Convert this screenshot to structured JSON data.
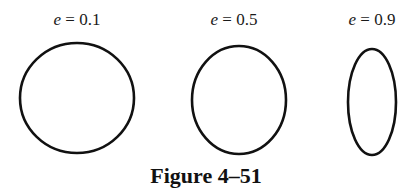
{
  "figure": {
    "caption": "Figure 4–51",
    "stroke_color": "#111111",
    "background": "#ffffff"
  },
  "ellipses": [
    {
      "label_var": "e",
      "label_eq": " = ",
      "label_value": "0.1",
      "eccentricity": 0.1,
      "cx": 77,
      "cy": 98,
      "rx": 57,
      "ry": 55
    },
    {
      "label_var": "e",
      "label_eq": " = ",
      "label_value": "0.5",
      "eccentricity": 0.5,
      "cx": 239,
      "cy": 100,
      "rx": 47,
      "ry": 54
    },
    {
      "label_var": "e",
      "label_eq": " = ",
      "label_value": "0.9",
      "eccentricity": 0.9,
      "cx": 372,
      "cy": 102,
      "rx": 24,
      "ry": 53
    }
  ]
}
